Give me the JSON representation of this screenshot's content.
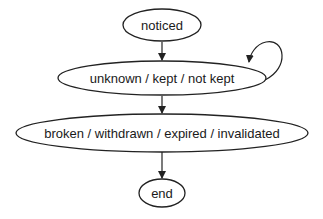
{
  "diagram": {
    "type": "state-diagram",
    "nodes": [
      {
        "id": "noticed",
        "label": "noticed"
      },
      {
        "id": "active",
        "label": "unknown / kept / not kept"
      },
      {
        "id": "terminal",
        "label": "broken / withdrawn / expired / invalidated"
      },
      {
        "id": "end",
        "label": "end"
      }
    ],
    "edges": [
      {
        "from": "noticed",
        "to": "active"
      },
      {
        "from": "active",
        "to": "active",
        "kind": "self-loop"
      },
      {
        "from": "active",
        "to": "terminal"
      },
      {
        "from": "terminal",
        "to": "end"
      }
    ],
    "colors": {
      "stroke": "#222222",
      "text": "#1a1a1a",
      "background": "#ffffff"
    }
  }
}
